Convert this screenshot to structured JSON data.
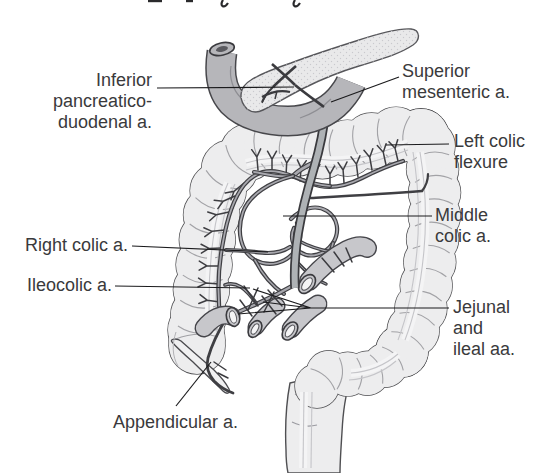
{
  "diagram": {
    "type": "anatomical-illustration",
    "labels": [
      {
        "id": "inferior-pancreaticoduodenal",
        "lines": [
          "Inferior",
          "pancreatico-",
          "duodenal a."
        ],
        "align": "right"
      },
      {
        "id": "superior-mesenteric",
        "lines": [
          "Superior",
          "mesenteric a."
        ],
        "align": "left"
      },
      {
        "id": "left-colic-flexure",
        "lines": [
          "Left colic",
          "flexure"
        ],
        "align": "left"
      },
      {
        "id": "middle-colic",
        "lines": [
          "Middle",
          "colic a."
        ],
        "align": "left"
      },
      {
        "id": "right-colic",
        "lines": [
          "Right colic a."
        ],
        "align": "right"
      },
      {
        "id": "ileocolic",
        "lines": [
          "Ileocolic a."
        ],
        "align": "right"
      },
      {
        "id": "jejunal-ileal",
        "lines": [
          "Jejunal",
          "and",
          "ileal aa."
        ],
        "align": "left"
      },
      {
        "id": "appendicular",
        "lines": [
          "Appendicular a."
        ],
        "align": "left"
      }
    ],
    "colors": {
      "background": "#ffffff",
      "label_text": "#3a3a3c",
      "leader_line": "#1b1b1d",
      "colon_fill": "#ededee",
      "outline": "#4f4f52",
      "artery_dark": "#3f3f43",
      "artery_core": "#a8a8ae",
      "sma_core": "#aeb2b5",
      "duodenum_fill": "#b6b6ba",
      "pancreas_fill": "#e9e9ea",
      "cut_bowel_fill": "#c7c7cb"
    }
  }
}
